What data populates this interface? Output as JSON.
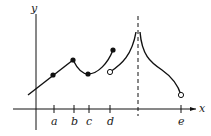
{
  "axes": {
    "x_label": "x",
    "y_label": "y"
  },
  "ticks": [
    {
      "label": "a",
      "x": 54
    },
    {
      "label": "b",
      "x": 74
    },
    {
      "label": "c",
      "x": 89
    },
    {
      "label": "d",
      "x": 110
    },
    {
      "label": "e",
      "x": 181
    }
  ],
  "asymptote": {
    "style": "dashed",
    "x": 138
  },
  "points": {
    "filled": [
      {
        "name": "at-a",
        "x": 53,
        "y": 75
      },
      {
        "name": "at-b",
        "x": 73,
        "y": 60
      },
      {
        "name": "at-c",
        "x": 88,
        "y": 74
      },
      {
        "name": "left-of-d",
        "x": 113,
        "y": 50
      }
    ],
    "open": [
      {
        "name": "at-d",
        "x": 110,
        "y": 72
      },
      {
        "name": "at-e",
        "x": 181,
        "y": 95
      }
    ]
  },
  "colors": {
    "stroke": "#111111",
    "background": "#ffffff"
  }
}
